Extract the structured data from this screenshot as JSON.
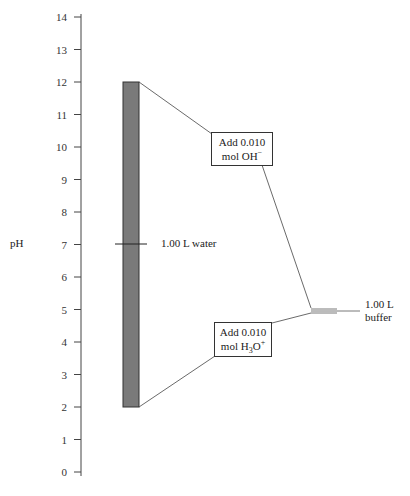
{
  "axis": {
    "label": "pH",
    "ticks": [
      "0",
      "1",
      "2",
      "3",
      "4",
      "5",
      "6",
      "7",
      "8",
      "9",
      "10",
      "11",
      "12",
      "13",
      "14"
    ]
  },
  "water": {
    "label": "1.00 L water",
    "initial_ph": 7,
    "range_top_ph": 12,
    "range_bottom_ph": 2,
    "bar_color": "#7a7a7a"
  },
  "buffer": {
    "label_line1": "1.00 L",
    "label_line2": "buffer",
    "ph": 4.9
  },
  "add_base": {
    "line1": "Add 0.010",
    "line2_prefix": "mol OH",
    "line2_sup": "−"
  },
  "add_acid": {
    "line1": "Add 0.010",
    "line2_prefix": "mol H",
    "line2_sub": "3",
    "line2_mid": "O",
    "line2_sup": "+"
  },
  "chart_data": {
    "type": "diagram",
    "title": "",
    "ylabel": "pH",
    "ylim": [
      0,
      14
    ],
    "ticks": [
      0,
      1,
      2,
      3,
      4,
      5,
      6,
      7,
      8,
      9,
      10,
      11,
      12,
      13,
      14
    ],
    "series": [
      {
        "name": "1.00 L water",
        "start_ph": 7,
        "after_base_ph": 12,
        "after_acid_ph": 2
      },
      {
        "name": "1.00 L buffer",
        "start_ph": 4.9,
        "after_base_ph": 4.95,
        "after_acid_ph": 4.85
      }
    ],
    "annotations": [
      "Add 0.010 mol OH−",
      "Add 0.010 mol H3O+"
    ]
  }
}
